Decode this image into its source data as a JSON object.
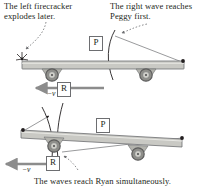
{
  "figure": {
    "type": "physics-relativity-diagram",
    "caption_top_left": "The left firecracker\nexplodes later.",
    "caption_top_right": "The right wave reaches\nPeggy first.",
    "caption_bottom": "The waves reach Ryan simultaneously.",
    "colors": {
      "ink": "#231f20",
      "car_body_fill": "#c9c9c4",
      "car_body_stroke": "#6d6e71",
      "wheel_rim": "#7a7a7a",
      "wheel_inner": "#bdbdb8",
      "wave_stroke": "#231f20",
      "arrow_fill": "#8c8c8c",
      "leader_dash": "#6d6e71"
    }
  },
  "panels": [
    {
      "id": "top-panel",
      "name": "peggy-frame-panel",
      "observer_label": "P",
      "observer_name": "Peggy",
      "velocity_label": "−v",
      "reference_label": "R",
      "reference_name": "Ryan",
      "firecracker_left": "left-firecracker-burst",
      "firecracker_right": "right-firecracker-point",
      "wave_fronts": 1,
      "note": "Right wave front has already passed; left firecracker explodes later."
    },
    {
      "id": "bottom-panel",
      "name": "ryan-frame-panel",
      "observer_label": "P",
      "observer_name": "Peggy",
      "velocity_label": "−v",
      "reference_label": "R",
      "reference_name": "Ryan",
      "firecracker_left": "left-firecracker-point",
      "firecracker_right": "right-firecracker-point",
      "wave_fronts": 2,
      "note": "Both wave fronts meet at Ryan at the same instant."
    }
  ]
}
